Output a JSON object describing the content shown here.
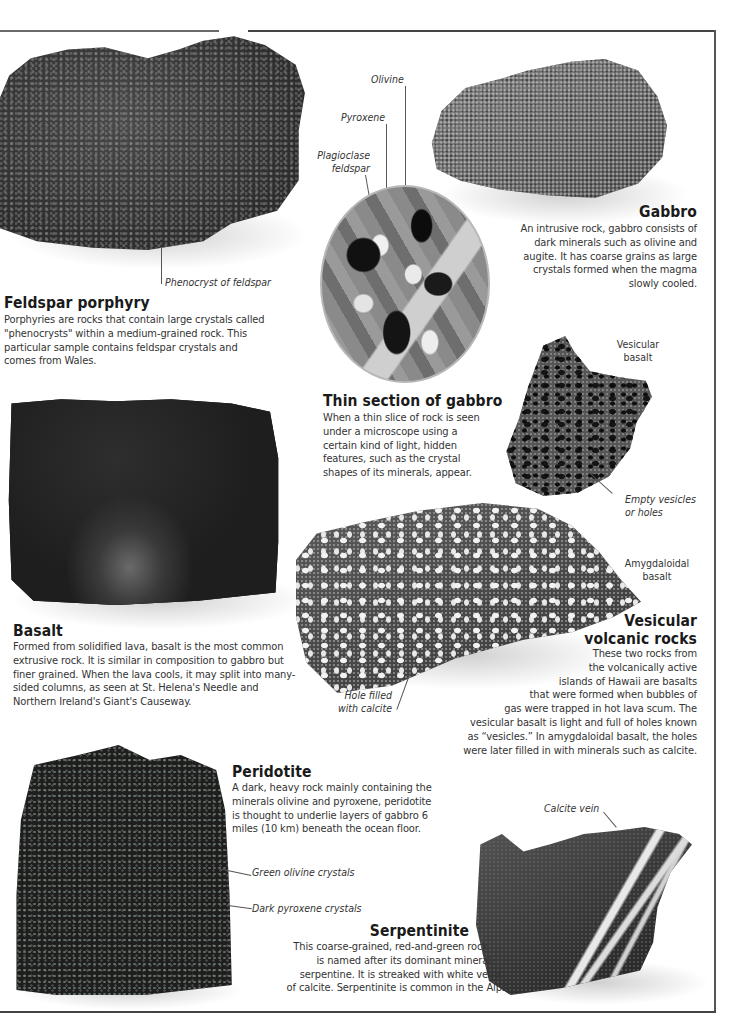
{
  "sections": {
    "feldspar_porphyry": {
      "title": "Feldspar porphyry",
      "body": "Porphyries are rocks that contain large crystals called \"phenocrysts\" within a medium-grained rock. This particular sample contains feldspar crystals and comes from Wales.",
      "labels": [
        "Phenocryst of feldspar"
      ]
    },
    "gabbro": {
      "title": "Gabbro",
      "body": "An intrusive rock, gabbro consists of dark minerals such as olivine and augite. It has coarse grains as large crystals formed when the magma slowly cooled."
    },
    "thin_section": {
      "title": "Thin section of gabbro",
      "body": "When a thin slice of rock is seen under a microscope using a certain kind of light, hidden features, such as the crystal shapes of its minerals, appear.",
      "labels": [
        "Olivine",
        "Pyroxene",
        "Plagioclase feldspar"
      ]
    },
    "basalt": {
      "title": "Basalt",
      "body": "Formed from solidified lava, basalt is the most common extrusive rock. It is similar in composition to gabbro but finer grained. When the lava cools, it may split into many-sided columns, as seen at St. Helena's Needle and Northern Ireland's Giant's Causeway."
    },
    "vesicular_volcanic": {
      "title_line1": "Vesicular",
      "title_line2": "volcanic rocks",
      "body_lines": [
        "These two rocks from",
        "the volcanically active",
        "islands of Hawaii are basalts",
        "that were formed when bubbles of",
        "gas were trapped in hot lava scum. The",
        "vesicular basalt is light and full of holes known",
        "as “vesicles.” In amygdaloidal basalt, the holes",
        "were later filled in with minerals such as calcite."
      ],
      "labels": {
        "vesicular_basalt_1": "Vesicular",
        "vesicular_basalt_2": "basalt",
        "empty_vesicles_1": "Empty vesicles",
        "empty_vesicles_2": "or holes",
        "amygdaloidal_1": "Amygdaloidal",
        "amygdaloidal_2": "basalt",
        "hole_filled_1": "Hole filled",
        "hole_filled_2": "with calcite"
      }
    },
    "peridotite": {
      "title": "Peridotite",
      "body": "A dark, heavy rock mainly containing the minerals olivine and pyroxene, peridotite is thought to underlie layers of gabbro 6 miles (10 km) beneath the ocean floor.",
      "labels": [
        "Green olivine crystals",
        "Dark pyroxene crystals"
      ]
    },
    "serpentinite": {
      "title": "Serpentinite",
      "body_lines": [
        "This coarse-grained, red-and-green rock",
        "is named after its dominant mineral,",
        "serpentine. It is streaked with white veins",
        "of calcite. Serpentinite is common in the Alps."
      ],
      "labels": [
        "Calcite vein"
      ]
    }
  }
}
